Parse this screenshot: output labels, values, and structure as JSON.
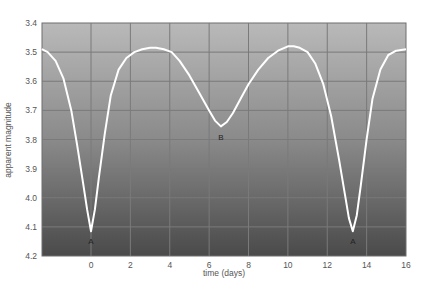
{
  "chart_data": {
    "type": "line",
    "title": "",
    "xlabel": "time (days)",
    "ylabel": "apparent magnitude",
    "xlim": [
      -2.5,
      16
    ],
    "ylim": [
      3.4,
      4.2
    ],
    "y_inverted": true,
    "grid": true,
    "legend": null,
    "x_ticks": [
      0,
      2,
      4,
      6,
      8,
      10,
      12,
      14,
      16
    ],
    "y_ticks": [
      "3.4",
      "3.5",
      "3.6",
      "3.7",
      "3.8",
      "3.9",
      "4.0",
      "4.1",
      "4.2"
    ],
    "series": [
      {
        "name": "light curve",
        "color": "#ffffff",
        "x": [
          -2.5,
          -2.2,
          -1.8,
          -1.4,
          -1.0,
          -0.7,
          -0.4,
          -0.2,
          0.0,
          0.2,
          0.4,
          0.7,
          1.0,
          1.4,
          1.8,
          2.2,
          2.6,
          3.0,
          3.3,
          3.7,
          4.1,
          4.5,
          5.0,
          5.5,
          6.0,
          6.3,
          6.6,
          6.9,
          7.2,
          7.6,
          8.0,
          8.5,
          9.0,
          9.5,
          10.0,
          10.3,
          10.6,
          11.0,
          11.4,
          11.8,
          12.2,
          12.6,
          12.9,
          13.1,
          13.3,
          13.5,
          13.7,
          14.0,
          14.3,
          14.7,
          15.1,
          15.5,
          16.0
        ],
        "y": [
          3.49,
          3.5,
          3.53,
          3.59,
          3.7,
          3.82,
          3.95,
          4.04,
          4.115,
          4.04,
          3.93,
          3.78,
          3.65,
          3.56,
          3.52,
          3.5,
          3.49,
          3.485,
          3.485,
          3.49,
          3.5,
          3.53,
          3.58,
          3.64,
          3.7,
          3.735,
          3.755,
          3.74,
          3.71,
          3.66,
          3.61,
          3.56,
          3.52,
          3.495,
          3.48,
          3.48,
          3.485,
          3.5,
          3.54,
          3.61,
          3.72,
          3.87,
          3.99,
          4.07,
          4.115,
          4.06,
          3.96,
          3.8,
          3.66,
          3.56,
          3.51,
          3.495,
          3.49
        ]
      }
    ],
    "annotations": [
      {
        "label": "A",
        "x": 0.0,
        "y": 4.15
      },
      {
        "label": "B",
        "x": 6.6,
        "y": 3.79
      },
      {
        "label": "A",
        "x": 13.3,
        "y": 4.15
      }
    ]
  },
  "colors": {
    "plot_top": "#b9b9b9",
    "plot_bottom": "#4a4a4a",
    "grid": "#7a7a7a",
    "curve": "#ffffff"
  }
}
